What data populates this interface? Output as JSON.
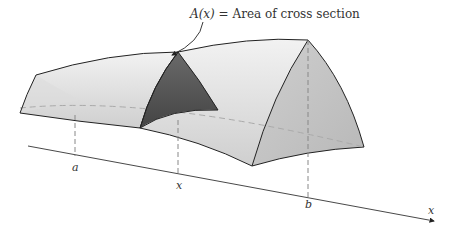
{
  "figure": {
    "caption": "A(x) = Area of cross section",
    "caption_func": "A(x)",
    "caption_rest": " = Area of cross section",
    "axis_label": "x",
    "tick_labels": {
      "a": "a",
      "x": "x",
      "b": "b"
    }
  },
  "colors": {
    "solid_light": "#e4e4e4",
    "solid_mid": "#c8c8c8",
    "end_face": "#bdbdbd",
    "cross_section": "#5a5a5a",
    "outline": "#222222",
    "dashed": "#999999"
  }
}
